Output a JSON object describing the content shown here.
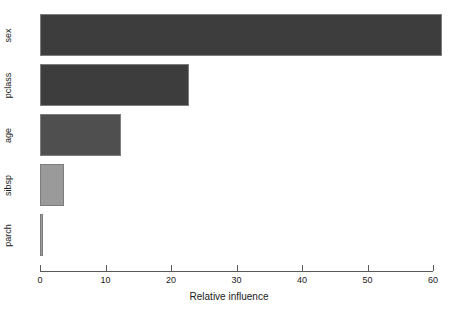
{
  "chart_data": {
    "type": "bar",
    "orientation": "horizontal",
    "title": "",
    "subtitle": "",
    "xlabel": "Relative influence",
    "ylabel": "",
    "categories": [
      "sex",
      "pclass",
      "age",
      "sibsp",
      "parch"
    ],
    "values": [
      61.3,
      22.8,
      12.4,
      3.6,
      0.4
    ],
    "series": [
      {
        "name": "Relative influence",
        "values": [
          61.3,
          22.8,
          12.4,
          3.6,
          0.4
        ]
      }
    ],
    "bar_colors": [
      "#3d3d3d",
      "#3d3d3d",
      "#4f4f4f",
      "#9a9a9a",
      "#9a9a9a"
    ],
    "bar_border_color": "#7d7d7d",
    "xlim": [
      0,
      60
    ],
    "xticks": [
      0,
      10,
      20,
      30,
      40,
      50,
      60
    ],
    "xtick_labels": [
      "0",
      "10",
      "20",
      "30",
      "40",
      "50",
      "60"
    ],
    "yticks": [
      "sex",
      "pclass",
      "age",
      "sibsp",
      "parch"
    ],
    "grid": false,
    "legend": false,
    "legend_position": "none",
    "background_color": "#ffffff",
    "axis_color": "#5a5a5a",
    "text_color": "#1a1a1a"
  },
  "bars": [
    {
      "label": "sex",
      "value": 61.3,
      "color": "#3d3d3d"
    },
    {
      "label": "pclass",
      "value": 22.8,
      "color": "#3d3d3d"
    },
    {
      "label": "age",
      "value": 12.4,
      "color": "#4f4f4f"
    },
    {
      "label": "sibsp",
      "value": 3.6,
      "color": "#9a9a9a"
    },
    {
      "label": "parch",
      "value": 0.4,
      "color": "#9a9a9a"
    }
  ],
  "axis": {
    "x_title": "Relative influence",
    "ticks": [
      {
        "label": "0",
        "value": 0
      },
      {
        "label": "10",
        "value": 10
      },
      {
        "label": "20",
        "value": 20
      },
      {
        "label": "30",
        "value": 30
      },
      {
        "label": "40",
        "value": 40
      },
      {
        "label": "50",
        "value": 50
      },
      {
        "label": "60",
        "value": 60
      }
    ]
  }
}
